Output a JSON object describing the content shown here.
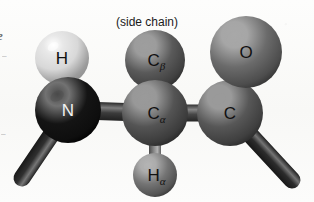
{
  "figure": {
    "name": "amino-acid-residue-ball-and-stick",
    "caption_side_chain": "(side chain)",
    "background_color": "#fbfbfa"
  },
  "atoms": [
    {
      "id": "amide-hydrogen",
      "symbol": "H",
      "subscript": "",
      "label_color": "#111111",
      "sphere_color": "#d8d8d8",
      "highlight_color": "#ffffff",
      "shadow_color": "#8e8e8e",
      "cx": 62,
      "cy": 58,
      "r": 27,
      "label_style": "dark"
    },
    {
      "id": "backbone-nitrogen",
      "symbol": "N",
      "subscript": "",
      "label_color": "#f2f2f2",
      "sphere_color": "#141414",
      "highlight_color": "#4a4a4a",
      "shadow_color": "#000000",
      "cx": 68,
      "cy": 110,
      "r": 33,
      "label_style": "light"
    },
    {
      "id": "beta-carbon",
      "symbol": "C",
      "subscript": "β",
      "label_color": "#111111",
      "sphere_color": "#5a5a5a",
      "highlight_color": "#9e9e9e",
      "shadow_color": "#2a2a2a",
      "cx": 155,
      "cy": 60,
      "r": 30,
      "label_style": "dark"
    },
    {
      "id": "alpha-carbon",
      "symbol": "C",
      "subscript": "α",
      "label_color": "#111111",
      "sphere_color": "#545454",
      "highlight_color": "#9a9a9a",
      "shadow_color": "#252525",
      "cx": 155,
      "cy": 113,
      "r": 33,
      "label_style": "dark"
    },
    {
      "id": "alpha-hydrogen",
      "symbol": "H",
      "subscript": "α",
      "label_color": "#111111",
      "sphere_color": "#747474",
      "highlight_color": "#b4b4b4",
      "shadow_color": "#333333",
      "cx": 155,
      "cy": 175,
      "r": 22,
      "label_style": "dark"
    },
    {
      "id": "carbonyl-carbon",
      "symbol": "C",
      "subscript": "",
      "label_color": "#111111",
      "sphere_color": "#575757",
      "highlight_color": "#9a9a9a",
      "shadow_color": "#282828",
      "cx": 230,
      "cy": 113,
      "r": 33,
      "label_style": "dark"
    },
    {
      "id": "carbonyl-oxygen",
      "symbol": "O",
      "subscript": "",
      "label_color": "#111111",
      "sphere_color": "#6b6b6b",
      "highlight_color": "#a8a8a8",
      "shadow_color": "#303030",
      "cx": 246,
      "cy": 52,
      "r": 36,
      "label_style": "dark"
    }
  ],
  "bonds": [
    {
      "id": "bond-n-h",
      "from": "backbone-nitrogen",
      "to": "amide-hydrogen",
      "x1": 68,
      "y1": 110,
      "x2": 62,
      "y2": 58,
      "width": 13,
      "color": "#7d7d7d"
    },
    {
      "id": "bond-n-prev",
      "from": "backbone-nitrogen",
      "to": "previous-residue",
      "x1": 68,
      "y1": 110,
      "x2": 22,
      "y2": 178,
      "width": 17,
      "color": "#2f2f2f"
    },
    {
      "id": "bond-n-ca",
      "from": "backbone-nitrogen",
      "to": "alpha-carbon",
      "x1": 68,
      "y1": 110,
      "x2": 155,
      "y2": 113,
      "width": 18,
      "color": "#3c3c3c"
    },
    {
      "id": "bond-ca-cb",
      "from": "alpha-carbon",
      "to": "beta-carbon",
      "x1": 155,
      "y1": 113,
      "x2": 155,
      "y2": 60,
      "width": 15,
      "color": "#545454"
    },
    {
      "id": "bond-ca-ha",
      "from": "alpha-carbon",
      "to": "alpha-hydrogen",
      "x1": 155,
      "y1": 113,
      "x2": 155,
      "y2": 175,
      "width": 12,
      "color": "#8a8a8a"
    },
    {
      "id": "bond-ca-c",
      "from": "alpha-carbon",
      "to": "carbonyl-carbon",
      "x1": 155,
      "y1": 113,
      "x2": 230,
      "y2": 113,
      "width": 17,
      "color": "#474747"
    },
    {
      "id": "bond-c-o",
      "from": "carbonyl-carbon",
      "to": "carbonyl-oxygen",
      "x1": 230,
      "y1": 113,
      "x2": 246,
      "y2": 52,
      "width": 16,
      "color": "#5e5e5e"
    },
    {
      "id": "bond-c-next",
      "from": "carbonyl-carbon",
      "to": "next-residue",
      "x1": 230,
      "y1": 113,
      "x2": 292,
      "y2": 180,
      "width": 17,
      "color": "#2c2c2c"
    }
  ],
  "edge_fragments": {
    "letter": "e",
    "tick_upper": "–",
    "tick_lower": "–"
  }
}
